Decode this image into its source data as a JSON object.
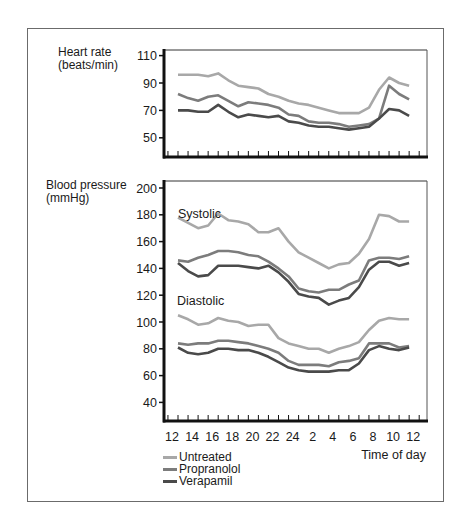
{
  "chart_data": [
    {
      "type": "line",
      "title": "Heart rate",
      "ylabel": "Heart rate (beats/min)",
      "xlabel": "Time of day",
      "ylim": [
        40,
        112
      ],
      "yticks": [
        50,
        70,
        90,
        110
      ],
      "grid": false,
      "x": [
        13,
        14,
        15,
        16,
        17,
        18,
        19,
        20,
        21,
        22,
        23,
        24,
        1,
        2,
        3,
        4,
        5,
        6,
        7,
        8,
        9,
        10,
        11,
        12
      ],
      "series": [
        {
          "name": "Untreated",
          "color": "#a8a8a8",
          "values": [
            96,
            96,
            96,
            95,
            97,
            92,
            88,
            87,
            86,
            82,
            80,
            77,
            75,
            74,
            72,
            70,
            68,
            68,
            68,
            72,
            85,
            94,
            90,
            88
          ]
        },
        {
          "name": "Propranolol",
          "color": "#7c7c7c",
          "values": [
            82,
            79,
            77,
            80,
            81,
            77,
            73,
            76,
            75,
            74,
            72,
            67,
            66,
            62,
            61,
            61,
            60,
            58,
            59,
            60,
            64,
            88,
            82,
            78
          ]
        },
        {
          "name": "Verapamil",
          "color": "#4a4a4a",
          "values": [
            70,
            70,
            69,
            69,
            74,
            69,
            65,
            67,
            66,
            65,
            66,
            62,
            61,
            59,
            58,
            58,
            57,
            56,
            57,
            58,
            64,
            71,
            70,
            66
          ]
        }
      ]
    },
    {
      "type": "line",
      "title": "Blood pressure",
      "ylabel": "Blood pressure (mmHg)",
      "xlabel": "Time of day",
      "ylim": [
        32,
        205
      ],
      "yticks": [
        40,
        60,
        80,
        100,
        120,
        140,
        160,
        180,
        200
      ],
      "grid": false,
      "annotations": [
        "Systolic",
        "Diastolic"
      ],
      "x": [
        13,
        14,
        15,
        16,
        17,
        18,
        19,
        20,
        21,
        22,
        23,
        24,
        1,
        2,
        3,
        4,
        5,
        6,
        7,
        8,
        9,
        10,
        11,
        12
      ],
      "series": [
        {
          "name": "Untreated (systolic)",
          "color": "#a8a8a8",
          "values": [
            178,
            174,
            170,
            172,
            181,
            176,
            175,
            173,
            167,
            167,
            170,
            160,
            152,
            148,
            144,
            140,
            143,
            144,
            151,
            162,
            180,
            179,
            175,
            175
          ]
        },
        {
          "name": "Propranolol (systolic)",
          "color": "#7c7c7c",
          "values": [
            146,
            145,
            148,
            150,
            153,
            153,
            152,
            150,
            149,
            145,
            140,
            134,
            125,
            123,
            122,
            124,
            124,
            128,
            131,
            146,
            148,
            148,
            147,
            149
          ]
        },
        {
          "name": "Verapamil (systolic)",
          "color": "#4a4a4a",
          "values": [
            144,
            138,
            134,
            135,
            142,
            142,
            142,
            141,
            140,
            142,
            137,
            130,
            121,
            119,
            118,
            113,
            116,
            118,
            126,
            139,
            145,
            145,
            142,
            144
          ]
        },
        {
          "name": "Untreated (diastolic)",
          "color": "#a8a8a8",
          "values": [
            105,
            102,
            98,
            99,
            103,
            101,
            100,
            97,
            98,
            98,
            88,
            84,
            82,
            80,
            80,
            77,
            80,
            82,
            85,
            94,
            101,
            103,
            102,
            102
          ]
        },
        {
          "name": "Propranolol (diastolic)",
          "color": "#7c7c7c",
          "values": [
            84,
            83,
            84,
            84,
            86,
            86,
            85,
            84,
            82,
            80,
            77,
            71,
            68,
            68,
            68,
            67,
            70,
            71,
            73,
            84,
            84,
            84,
            81,
            82
          ]
        },
        {
          "name": "Verapamil (diastolic)",
          "color": "#4a4a4a",
          "values": [
            81,
            77,
            76,
            77,
            80,
            80,
            79,
            79,
            77,
            74,
            70,
            66,
            64,
            63,
            63,
            63,
            64,
            64,
            69,
            79,
            82,
            80,
            79,
            81
          ]
        }
      ]
    }
  ],
  "labels": {
    "heart_rate_line1": "Heart rate",
    "heart_rate_line2": "(beats/min)",
    "bp_line1": "Blood pressure",
    "bp_line2": "(mmHg)",
    "systolic": "Systolic",
    "diastolic": "Diastolic",
    "x_axis_title": "Time of day",
    "x_tick_labels": [
      "12",
      "14",
      "16",
      "18",
      "20",
      "22",
      "24",
      "2",
      "4",
      "6",
      "8",
      "10",
      "12"
    ]
  },
  "legend": [
    {
      "label": "Untreated",
      "color": "#a8a8a8"
    },
    {
      "label": "Propranolol",
      "color": "#7c7c7c"
    },
    {
      "label": "Verapamil",
      "color": "#4a4a4a"
    }
  ]
}
